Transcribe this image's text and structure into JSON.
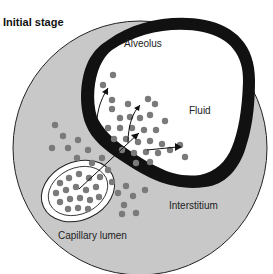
{
  "title": "Initial stage",
  "labels": {
    "alveolus": "Alveolus",
    "fluid": "Fluid",
    "interstitium": "Interstitium",
    "capillary": "Capillary lumen"
  },
  "colors": {
    "interstitium_fill": "#c8c8c8",
    "alveolar_wall": "#111111",
    "alveolus_fill": "#ffffff",
    "particle": "#7a7a7a",
    "outline": "#222222"
  }
}
